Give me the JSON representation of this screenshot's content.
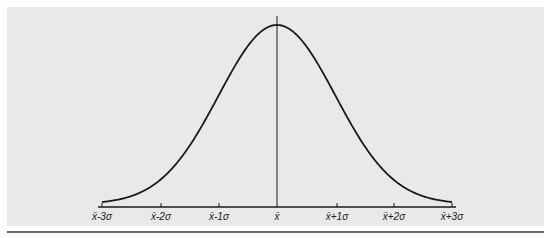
{
  "chart_data": {
    "type": "line",
    "title": "",
    "xlabel": "",
    "ylabel": "",
    "x": [
      -3,
      -2,
      -1,
      0,
      1,
      2,
      3
    ],
    "tick_labels": [
      "x̄-3σ",
      "x̄-2σ",
      "x̄-1σ",
      "x̄",
      "x̄+1σ",
      "x̄+2σ",
      "x̄+3σ"
    ],
    "series": [
      {
        "name": "normal density",
        "values": [
          0.0044,
          0.054,
          0.242,
          0.399,
          0.242,
          0.054,
          0.0044
        ]
      }
    ],
    "mean_line": true,
    "grid": false,
    "legend": false
  },
  "ticks": [
    {
      "label": "x̄-3σ",
      "base": "x̄",
      "suffix": "-3σ",
      "x": 102
    },
    {
      "label": "x̄-2σ",
      "base": "x̄",
      "suffix": "-2σ",
      "x": 161
    },
    {
      "label": "x̄-1σ",
      "base": "x̄",
      "suffix": "-1σ",
      "x": 219
    },
    {
      "label": "x̄",
      "base": "x̄",
      "suffix": "",
      "x": 277
    },
    {
      "label": "x̄+1σ",
      "base": "x̄",
      "suffix": "+1σ",
      "x": 337
    },
    {
      "label": "x̄+2σ",
      "base": "x̄",
      "suffix": "+2σ",
      "x": 394
    },
    {
      "label": "x̄+3σ",
      "base": "x̄",
      "suffix": "+3σ",
      "x": 452
    }
  ],
  "colors": {
    "panel": "#e9e9e9",
    "line": "#1a1a1a",
    "rule": "#6a6a6a"
  }
}
